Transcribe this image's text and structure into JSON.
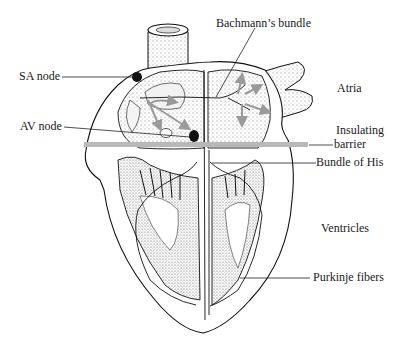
{
  "diagram": {
    "type": "anatomical-illustration",
    "colors": {
      "line": "#111111",
      "barrier": "#b8b8b8",
      "arrow": "#9a9a9a",
      "stipple": "#888888",
      "background": "#ffffff"
    },
    "labels": {
      "bachmann": "Bachmann’s bundle",
      "sa_node": "SA node",
      "av_node": "AV node",
      "atria": "Atria",
      "insulating_1": "Insulating",
      "insulating_2": "barrier",
      "bundle_his": "Bundle of His",
      "ventricles": "Ventricles",
      "purkinje": "Purkinje fibers"
    }
  }
}
